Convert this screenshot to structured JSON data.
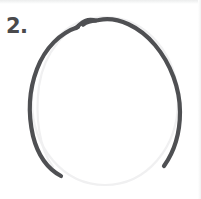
{
  "page": {
    "background_color": "#ffffff",
    "width": 201,
    "height": 199
  },
  "step": {
    "number_label": "2.",
    "number_color": "#4a4a4c"
  },
  "sketch": {
    "subject": "hand-drawn head outline circle",
    "inked_stroke": {
      "name": "inked-head-outline",
      "color": "#4f5053",
      "width_px": 4.2,
      "cap": "round",
      "description": "dark pencil stroke covering top, left and right of the oval; open at the bottom"
    },
    "guide_stroke": {
      "name": "faint-construction-circle",
      "color": "#f0f0f1",
      "width_px": 2.2,
      "cap": "round",
      "description": "very light grey construction circle visible at the bottom and just inside the left edge"
    },
    "start_notch": {
      "name": "pen-start-notch",
      "description": "small overlap kink where the pen stroke begins near the top-left of the arc",
      "x": 84,
      "y": 22
    },
    "ellipse": {
      "center_x": 105,
      "center_y": 105,
      "radius_x": 76,
      "radius_y": 89
    }
  }
}
